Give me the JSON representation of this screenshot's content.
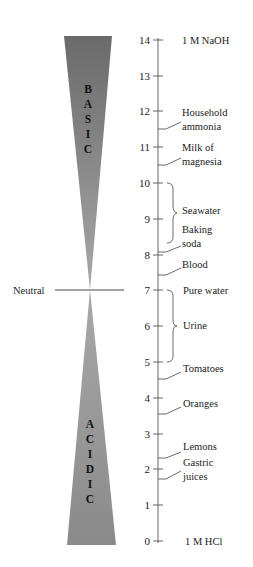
{
  "diagram": {
    "neutral_label": "Neutral",
    "basic_letters": [
      "B",
      "A",
      "S",
      "I",
      "C"
    ],
    "acidic_letters": [
      "A",
      "C",
      "I",
      "D",
      "I",
      "C"
    ],
    "colors": {
      "wedge_dark": "#6e6e6e",
      "wedge_light": "#a6a6a6",
      "line": "#333333"
    },
    "axis": {
      "ticks": [
        "0",
        "1",
        "2",
        "3",
        "4",
        "5",
        "6",
        "7",
        "8",
        "9",
        "10",
        "11",
        "12",
        "13",
        "14"
      ]
    },
    "substances": {
      "naoh": "1 M NaOH",
      "ammonia_1": "Household",
      "ammonia_2": "ammonia",
      "milk_1": "Milk of",
      "milk_2": "magnesia",
      "seawater": "Seawater",
      "baking_1": "Baking",
      "baking_2": "soda",
      "blood": "Blood",
      "pure_water": "Pure water",
      "urine": "Urine",
      "tomatoes": "Tomatoes",
      "oranges": "Oranges",
      "lemons": "Lemons",
      "gastric_1": "Gastric",
      "gastric_2": "juices",
      "hcl": "1 M HCl"
    }
  }
}
